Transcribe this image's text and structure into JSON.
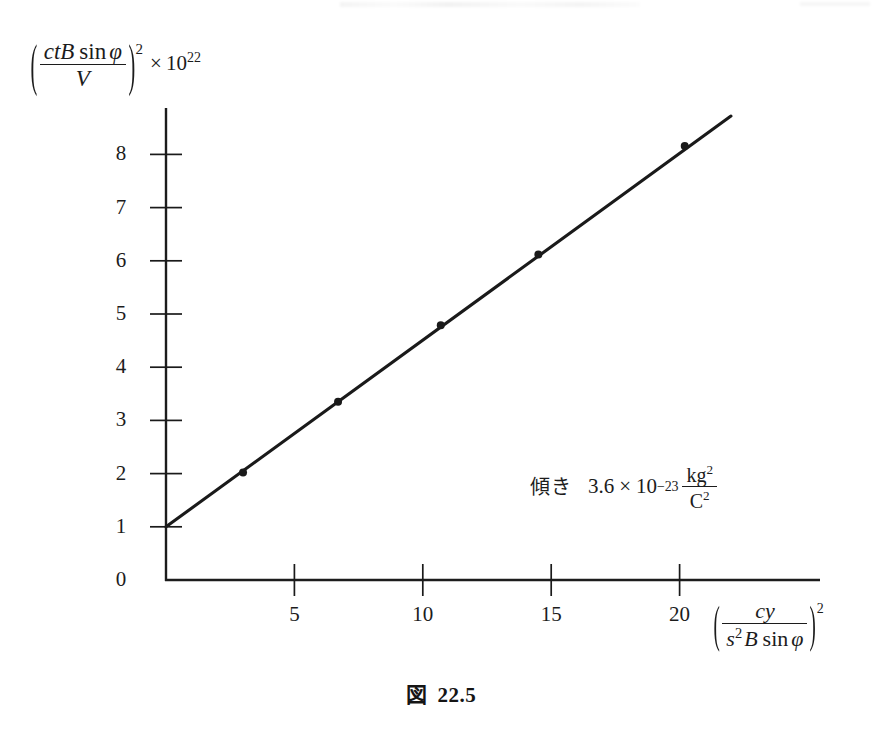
{
  "chart_data": {
    "type": "line",
    "title": "",
    "subtitle": "",
    "xlabel_plain": "(cy / (s^2 B sin phi))^2",
    "ylabel_plain": "(ctB sin phi / V)^2 x 10^22",
    "xlim": [
      0,
      22.5
    ],
    "ylim": [
      0,
      8.9
    ],
    "grid": false,
    "legend": "none",
    "x_ticks": [
      5,
      10,
      15,
      20
    ],
    "x_tick_labels": [
      "5",
      "10",
      "15",
      "20"
    ],
    "y_ticks": [
      0,
      1,
      2,
      3,
      4,
      5,
      6,
      7,
      8
    ],
    "y_tick_labels": [
      "0",
      "1",
      "2",
      "3",
      "4",
      "5",
      "6",
      "7",
      "8"
    ],
    "series": [
      {
        "name": "measurements",
        "marker": "dot",
        "color": "#1a1a1a",
        "x": [
          3.0,
          6.7,
          10.7,
          14.5,
          20.2
        ],
        "values": [
          2.02,
          3.35,
          4.79,
          6.12,
          8.16
        ]
      },
      {
        "name": "best-fit-line",
        "marker": "none",
        "color": "#1a1a1a",
        "x": [
          0.0,
          22.0
        ],
        "values": [
          1.0,
          8.72
        ],
        "intercept": 1.0,
        "slope": 0.3509
      }
    ],
    "annotations": [
      {
        "name": "slope-annotation",
        "label_jp": "傾き",
        "coefficient": "3.6",
        "times": "×",
        "base": "10",
        "exponent": "−23",
        "unit_numerator": "kg",
        "unit_numerator_exp": "2",
        "unit_denominator": "C",
        "unit_denominator_exp": "2",
        "plain": "傾き 3.6 × 10^−23 kg^2 / C^2"
      }
    ]
  },
  "ylabel": {
    "open_paren": "(",
    "numerator": {
      "c": "c",
      "t": "t",
      "B": "B",
      "sin": "sin",
      "phi": "φ"
    },
    "denominator": "V",
    "close_paren": ")",
    "outer_exponent": "2",
    "times": "×",
    "scale_base": "10",
    "scale_exponent": "22"
  },
  "xlabel": {
    "open_paren": "(",
    "numerator": {
      "c": "c",
      "y": "y"
    },
    "denominator": {
      "s": "s",
      "s_exp": "2",
      "B": "B",
      "sin": "sin",
      "phi": "φ"
    },
    "close_paren": ")",
    "outer_exponent": "2"
  },
  "caption": {
    "prefix": "図",
    "number": "22.5"
  },
  "colors": {
    "ink": "#1a1a1a",
    "axis": "#1c1c1c",
    "background": "#ffffff"
  }
}
